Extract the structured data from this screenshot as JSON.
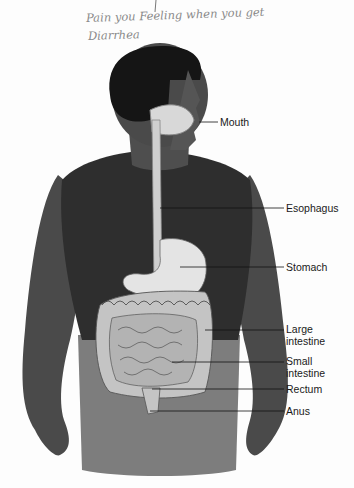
{
  "annotation": {
    "line1": "Pain you Feeling when you get",
    "line2": "Diarrhea"
  },
  "figure": {
    "colors": {
      "skin": "#4a4a4a",
      "hair": "#151515",
      "shirt": "#2e2e2e",
      "pants": "#7a7a7a",
      "organ": "#c9c9c9",
      "organ_light": "#e6e6e6",
      "leader_line": "#111111"
    }
  },
  "labels": [
    {
      "id": "mouth",
      "text": "Mouth"
    },
    {
      "id": "esophagus",
      "text": "Esophagus"
    },
    {
      "id": "stomach",
      "text": "Stomach"
    },
    {
      "id": "large_intestine_1",
      "text": "Large"
    },
    {
      "id": "large_intestine_2",
      "text": "intestine"
    },
    {
      "id": "small_intestine_1",
      "text": "Small"
    },
    {
      "id": "small_intestine_2",
      "text": "intestine"
    },
    {
      "id": "rectum",
      "text": "Rectum"
    },
    {
      "id": "anus",
      "text": "Anus"
    }
  ]
}
